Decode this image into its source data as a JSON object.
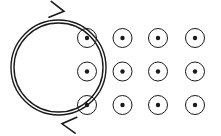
{
  "figure": {
    "background_color": "#ffffff",
    "stroke_color": "#1a1a1a",
    "width": 221,
    "height": 136
  },
  "current_loop": {
    "label": "current-loop",
    "shape": "circle",
    "center_x": 58.5,
    "center_y": 67.5,
    "radius_outer": 47.5,
    "radius_inner": 44.5,
    "stroke_width": 1.4,
    "double_line": true,
    "circulation": "clockwise",
    "arrows": [
      {
        "name": "top-arrowhead",
        "x": 62,
        "y": 11,
        "rotation_deg": 8,
        "direction": "right"
      },
      {
        "name": "bottom-arrowhead",
        "x": 64,
        "y": 124,
        "rotation_deg": 186,
        "direction": "left"
      }
    ]
  },
  "field_symbols": {
    "label": "magnetic-field-out-of-page",
    "symbol": "circled-dot",
    "meaning": "field out of page",
    "columns": 4,
    "rows": 3,
    "circle_radius": 9.5,
    "dot_radius": 2.2,
    "stroke_width": 1.0,
    "column_x": [
      87,
      122.5,
      158,
      195
    ],
    "row_y": [
      38,
      71.5,
      105
    ],
    "points": [
      {
        "col": 1,
        "row": 1,
        "x": 87,
        "y": 38
      },
      {
        "col": 2,
        "row": 1,
        "x": 122.5,
        "y": 38
      },
      {
        "col": 3,
        "row": 1,
        "x": 158,
        "y": 38
      },
      {
        "col": 4,
        "row": 1,
        "x": 195,
        "y": 38
      },
      {
        "col": 1,
        "row": 2,
        "x": 87,
        "y": 71.5
      },
      {
        "col": 2,
        "row": 2,
        "x": 122.5,
        "y": 71.5
      },
      {
        "col": 3,
        "row": 2,
        "x": 158,
        "y": 71.5
      },
      {
        "col": 4,
        "row": 2,
        "x": 195,
        "y": 71.5
      },
      {
        "col": 1,
        "row": 3,
        "x": 87,
        "y": 105
      },
      {
        "col": 2,
        "row": 3,
        "x": 122.5,
        "y": 105
      },
      {
        "col": 3,
        "row": 3,
        "x": 158,
        "y": 105
      },
      {
        "col": 4,
        "row": 3,
        "x": 195,
        "y": 105
      }
    ]
  }
}
